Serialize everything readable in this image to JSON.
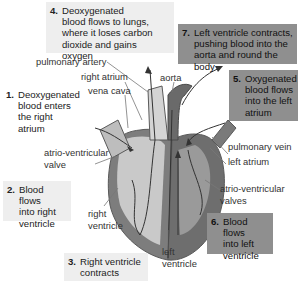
{
  "diagram": {
    "steps": [
      {
        "num": "1.",
        "text": "Deoxygenated blood enters the right atrium",
        "lines": [
          "Deoxygenated",
          "blood enters",
          "the right atrium"
        ]
      },
      {
        "num": "2.",
        "text": "Blood flows into right ventricle",
        "lines": [
          "Blood flows",
          "into right",
          "ventricle"
        ]
      },
      {
        "num": "3.",
        "text": "Right ventricle contracts",
        "lines": [
          "Right ventricle",
          "contracts"
        ]
      },
      {
        "num": "4.",
        "text": "Deoxygenated blood flows to lungs, where it loses carbon dioxide and gains oxygen",
        "lines": [
          "Deoxygenated",
          "blood flows to lungs,",
          "where it loses carbon",
          "dioxide and gains oxygen"
        ]
      },
      {
        "num": "5.",
        "text": "Oxygenated blood flows into the left atrium",
        "lines": [
          "Oxygenated",
          "blood flows",
          "into the left",
          "atrium"
        ]
      },
      {
        "num": "6.",
        "text": "Blood flows into left ventricle",
        "lines": [
          "Blood flows",
          "into left",
          "ventricle"
        ]
      },
      {
        "num": "7.",
        "text": "Left ventricle contracts, pushing blood into the aorta and round the body",
        "lines": [
          "Left ventricle contracts,",
          "pushing blood into the",
          "aorta and round the body"
        ]
      }
    ],
    "labels": {
      "pulmonary_artery": "pulmonary artery",
      "right_atrium": "right atrium",
      "vena_cava": "vena cava",
      "aorta": "aorta",
      "pulmonary_vein": "pulmonary vein",
      "left_atrium": "left atrium",
      "av_valve_right": [
        "atrio-ventricular",
        "valve"
      ],
      "av_valves_left": [
        "atrio-ventricular",
        "valves"
      ],
      "right_ventricle": [
        "right",
        "ventricle"
      ],
      "left_ventricle": [
        "left",
        "ventricle"
      ]
    },
    "colors": {
      "light_box": "#eeeeee",
      "dark_box": "#8f8f8f",
      "right_side": "#c8c8c8",
      "left_side": "#7a7a7a",
      "outline": "#5a5a5a"
    }
  }
}
